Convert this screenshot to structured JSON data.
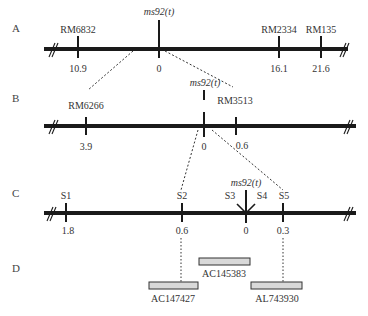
{
  "panels": {
    "A": {
      "label": "A",
      "gene_label": "ms92(t)",
      "markers": [
        {
          "name": "RM6832",
          "value": "10.9"
        },
        {
          "name": "",
          "value": "0"
        },
        {
          "name": "RM2334",
          "value": "16.1"
        },
        {
          "name": "RM135",
          "value": "21.6"
        }
      ]
    },
    "B": {
      "label": "B",
      "gene_label": "ms92(t)",
      "markers": [
        {
          "name": "RM6266",
          "value": "3.9"
        },
        {
          "name": "",
          "value": "0"
        },
        {
          "name": "RM3513",
          "value": "0.6"
        }
      ]
    },
    "C": {
      "label": "C",
      "gene_label": "ms92(t)",
      "markers": [
        {
          "name": "S1",
          "value": "1.8"
        },
        {
          "name": "S2",
          "value": "0.6"
        },
        {
          "name": "S3",
          "value": ""
        },
        {
          "name": "S4",
          "value": "0"
        },
        {
          "name": "S5",
          "value": "0.3"
        }
      ]
    },
    "D": {
      "label": "D",
      "clones": [
        "AC145383",
        "AC147427",
        "AL743930"
      ]
    }
  },
  "colors": {
    "line": "#1a1a1a",
    "clone_fill": "#d9d9d9",
    "clone_stroke": "#333333"
  }
}
